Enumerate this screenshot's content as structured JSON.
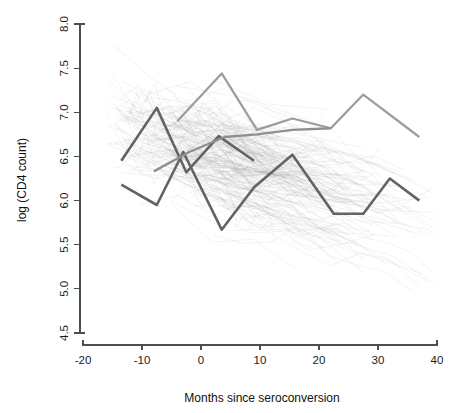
{
  "chart_data": {
    "type": "line",
    "title": "",
    "xlabel": "Months since seroconversion",
    "ylabel": "log (CD4 count)",
    "xlim": [
      -20,
      40
    ],
    "ylim": [
      4.5,
      8.0
    ],
    "xticks": [
      -20,
      -10,
      0,
      10,
      20,
      30,
      40
    ],
    "xticklabels": [
      "-20",
      "-10",
      "0",
      "10",
      "20",
      "30",
      "40"
    ],
    "yticks": [
      4.5,
      5.0,
      5.5,
      6.0,
      6.5,
      7.0,
      7.5,
      8.0
    ],
    "yticklabels": [
      "4.5",
      "5.0",
      "5.5",
      "6.0",
      "6.5",
      "7.0",
      "7.5",
      "8.0"
    ],
    "grid": false,
    "legend": null,
    "background_series_style": {
      "color": "#8a8a8a",
      "opacity": 0.2,
      "width": 0.55,
      "description": "spaghetti plot of many individual subject CD4 trajectories"
    },
    "highlighted_series": [
      {
        "name": "subject-a-dark",
        "color": "#636363",
        "width": 2.6,
        "x": [
          -13.5,
          -7.5,
          -3.0,
          3.5,
          9.0,
          15.5,
          22.5,
          27.5,
          32.0,
          37.0
        ],
        "y": [
          6.18,
          5.95,
          6.55,
          5.67,
          6.15,
          6.52,
          5.85,
          5.85,
          6.25,
          6.0
        ]
      },
      {
        "name": "subject-b-dark-peak",
        "color": "#636363",
        "width": 2.6,
        "x": [
          -13.5,
          -7.5,
          -2.5,
          3.0,
          9.0
        ],
        "y": [
          6.45,
          7.05,
          6.32,
          6.73,
          6.45
        ]
      },
      {
        "name": "subject-c-light",
        "color": "#9c9c9c",
        "width": 2.2,
        "x": [
          -4.0,
          3.5,
          9.5,
          15.5,
          22.0,
          27.5,
          37.0
        ],
        "y": [
          6.9,
          7.44,
          6.8,
          6.93,
          6.82,
          7.2,
          6.72
        ]
      },
      {
        "name": "subject-d-mid",
        "color": "#8f8f8f",
        "width": 2.4,
        "x": [
          -8.0,
          -2.0,
          4.0,
          9.5,
          15.5,
          22.0
        ],
        "y": [
          6.33,
          6.55,
          6.72,
          6.75,
          6.8,
          6.82
        ]
      }
    ],
    "n_background_lines": 230
  }
}
